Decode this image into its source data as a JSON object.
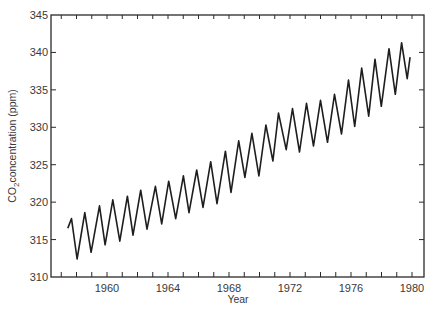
{
  "chart_data": {
    "type": "line",
    "title": "",
    "xlabel": "Year",
    "ylabel": "CO2 concentration (ppm)",
    "ylabel_parts": {
      "pre": "CO",
      "sub": "2",
      "post": "concentration (ppm)"
    },
    "xlim": [
      1956.3,
      1980.7
    ],
    "ylim": [
      310,
      345
    ],
    "x_ticks_labeled": [
      1960,
      1964,
      1968,
      1972,
      1976,
      1980
    ],
    "x_tick_labels": [
      "1960",
      "1964",
      "1968",
      "1972",
      "1976",
      "1980"
    ],
    "y_ticks": [
      310,
      315,
      320,
      325,
      330,
      335,
      340,
      345
    ],
    "y_tick_labels": [
      "310",
      "315",
      "320",
      "325",
      "330",
      "335",
      "340",
      "345"
    ],
    "grid": false,
    "legend": null,
    "series": [
      {
        "name": "Mauna Loa CO2 (seasonal cycle)",
        "color": "#1e1e1e",
        "points": [
          [
            1958.05,
            316.6
          ],
          [
            1958.3,
            317.8
          ],
          [
            1958.7,
            312.4
          ],
          [
            1959.25,
            318.6
          ],
          [
            1959.7,
            313.3
          ],
          [
            1960.3,
            319.5
          ],
          [
            1960.7,
            314.3
          ],
          [
            1961.25,
            320.3
          ],
          [
            1961.75,
            314.8
          ],
          [
            1962.3,
            320.8
          ],
          [
            1962.7,
            315.6
          ],
          [
            1963.25,
            321.6
          ],
          [
            1963.7,
            316.4
          ],
          [
            1964.3,
            322.1
          ],
          [
            1964.75,
            317.1
          ],
          [
            1965.25,
            322.8
          ],
          [
            1965.75,
            317.8
          ],
          [
            1966.3,
            323.5
          ],
          [
            1966.7,
            318.6
          ],
          [
            1967.25,
            324.3
          ],
          [
            1967.7,
            319.3
          ],
          [
            1968.25,
            325.4
          ],
          [
            1968.7,
            319.8
          ],
          [
            1969.3,
            326.8
          ],
          [
            1969.7,
            321.3
          ],
          [
            1970.25,
            328.2
          ],
          [
            1970.7,
            323.3
          ],
          [
            1971.2,
            329.2
          ],
          [
            1971.7,
            323.5
          ],
          [
            1972.2,
            330.3
          ],
          [
            1972.7,
            325.5
          ],
          [
            1973.1,
            331.9
          ],
          [
            1973.65,
            327.0
          ],
          [
            1974.1,
            332.5
          ],
          [
            1974.6,
            326.7
          ],
          [
            1975.1,
            333.2
          ],
          [
            1975.6,
            327.5
          ],
          [
            1976.1,
            333.6
          ],
          [
            1976.6,
            328.0
          ],
          [
            1977.1,
            334.4
          ],
          [
            1977.6,
            329.1
          ],
          [
            1978.1,
            336.3
          ],
          [
            1978.55,
            330.1
          ],
          [
            1979.05,
            337.9
          ],
          [
            1979.55,
            331.5
          ],
          [
            1980.0,
            339.1
          ],
          [
            1980.45,
            332.8
          ],
          [
            1981.0,
            340.5
          ],
          [
            1981.45,
            334.4
          ],
          [
            1981.9,
            341.3
          ],
          [
            1982.3,
            336.5
          ],
          [
            1982.5,
            339.3
          ]
        ]
      }
    ]
  }
}
